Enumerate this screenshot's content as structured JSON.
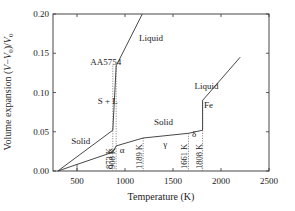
{
  "chart_data": {
    "type": "line",
    "title": "",
    "xlabel": "Temperature (K)",
    "ylabel": "Volume expansion (V−V0)/V0",
    "xlim": [
      250,
      2500
    ],
    "ylim": [
      0.0,
      0.2
    ],
    "xticks": [
      500,
      1000,
      1500,
      2000,
      2500
    ],
    "yticks": [
      "0.00",
      "0.05",
      "0.10",
      "0.15",
      "0.20"
    ],
    "grid": false,
    "legend": "none",
    "series": [
      {
        "name": "AA5754",
        "points": [
          [
            300,
            0.0
          ],
          [
            873,
            0.052
          ],
          [
            908,
            0.134
          ],
          [
            1180,
            0.2
          ]
        ]
      },
      {
        "name": "Fe",
        "points": [
          [
            300,
            0.0
          ],
          [
            873,
            0.024
          ],
          [
            908,
            0.032
          ],
          [
            1189,
            0.042
          ],
          [
            1661,
            0.048
          ],
          [
            1808,
            0.052
          ],
          [
            1808,
            0.09
          ],
          [
            2200,
            0.145
          ]
        ]
      }
    ],
    "vlines": [
      {
        "x": 873,
        "label": "873 K"
      },
      {
        "x": 908,
        "label": "908 K"
      },
      {
        "x": 1189,
        "label": "1189 K"
      },
      {
        "x": 1661,
        "label": "1661 K"
      },
      {
        "x": 1808,
        "label": "1808 K"
      }
    ],
    "annotations": [
      {
        "text": "AA5754",
        "x": 800,
        "y": 0.135
      },
      {
        "text": "Liquid",
        "x": 1270,
        "y": 0.165
      },
      {
        "text": "S + L",
        "x": 820,
        "y": 0.085
      },
      {
        "text": "Solid",
        "x": 540,
        "y": 0.035
      },
      {
        "text": "Solid",
        "x": 1400,
        "y": 0.058
      },
      {
        "text": "Liquid",
        "x": 1850,
        "y": 0.105
      },
      {
        "text": "Fe",
        "x": 1870,
        "y": 0.08
      },
      {
        "text": "α",
        "x": 970,
        "y": 0.023
      },
      {
        "text": "γ",
        "x": 1420,
        "y": 0.03
      },
      {
        "text": "δ",
        "x": 1720,
        "y": 0.043
      }
    ]
  }
}
